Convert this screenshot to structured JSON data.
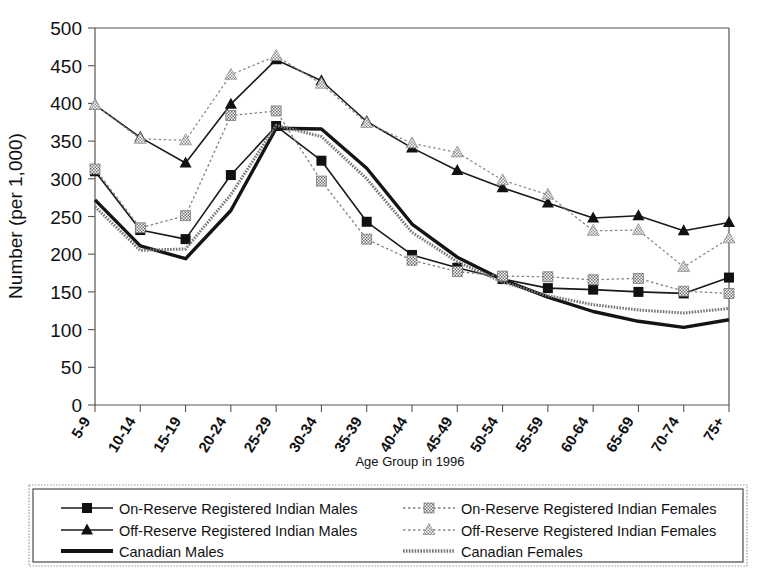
{
  "chart_data": {
    "type": "line",
    "title": "",
    "xlabel": "Age Group in 1996",
    "ylabel": "Number (per 1,000)",
    "ylim": [
      0,
      500
    ],
    "ytick_step": 50,
    "yticks": [
      0,
      50,
      100,
      150,
      200,
      250,
      300,
      350,
      400,
      450,
      500
    ],
    "grid": false,
    "legend_position": "bottom",
    "categories": [
      "5-9",
      "10-14",
      "15-19",
      "20-24",
      "25-29",
      "30-34",
      "35-39",
      "40-44",
      "45-49",
      "50-54",
      "55-59",
      "60-64",
      "65-69",
      "70-74",
      "75+"
    ],
    "series": [
      {
        "name": "On-Reserve Registered Indian Males",
        "marker": "square",
        "style": "solid",
        "color": "#1a1a1a",
        "values": [
          310,
          232,
          220,
          305,
          370,
          324,
          243,
          199,
          182,
          167,
          155,
          153,
          150,
          148,
          169
        ]
      },
      {
        "name": "Off-Reserve Registered Indian Males",
        "marker": "triangle",
        "style": "solid",
        "color": "#1a1a1a",
        "values": [
          398,
          355,
          321,
          399,
          458,
          430,
          376,
          341,
          311,
          288,
          268,
          248,
          251,
          231,
          242
        ]
      },
      {
        "name": "Canadian Males",
        "marker": "none",
        "style": "thick",
        "color": "#141414",
        "values": [
          272,
          211,
          194,
          258,
          367,
          366,
          314,
          240,
          196,
          166,
          143,
          124,
          111,
          103,
          113
        ]
      },
      {
        "name": "On-Reserve Registered Indian Females",
        "marker": "square-hatched",
        "style": "dotted",
        "color": "#808080",
        "values": [
          313,
          235,
          251,
          384,
          390,
          297,
          220,
          192,
          177,
          171,
          170,
          166,
          168,
          151,
          148
        ]
      },
      {
        "name": "Off-Reserve Registered Indian Females",
        "marker": "triangle-hatched",
        "style": "dotted",
        "color": "#8a8a8a",
        "values": [
          398,
          353,
          351,
          438,
          463,
          426,
          374,
          347,
          335,
          298,
          279,
          231,
          232,
          183,
          221
        ]
      },
      {
        "name": "Canadian Females",
        "marker": "none",
        "style": "thick-hatched",
        "color": "#777777",
        "values": [
          263,
          205,
          207,
          279,
          371,
          356,
          300,
          229,
          190,
          163,
          145,
          133,
          126,
          122,
          128
        ]
      }
    ]
  },
  "legend": {
    "entries": [
      {
        "label": "On-Reserve Registered Indian Males",
        "series_index": 0
      },
      {
        "label": "Off-Reserve Registered Indian Males",
        "series_index": 1
      },
      {
        "label": "Canadian Males",
        "series_index": 2
      },
      {
        "label": "On-Reserve Registered Indian Females",
        "series_index": 3
      },
      {
        "label": "Off-Reserve Registered Indian Females",
        "series_index": 4
      },
      {
        "label": "Canadian Females",
        "series_index": 5
      }
    ]
  }
}
